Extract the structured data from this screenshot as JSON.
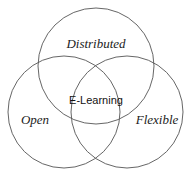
{
  "diagram": {
    "type": "venn",
    "sets": [
      {
        "id": "distributed",
        "label": "Distributed"
      },
      {
        "id": "open",
        "label": "Open"
      },
      {
        "id": "flexible",
        "label": "Flexible"
      }
    ],
    "intersection": {
      "label": "E-Learning"
    },
    "colors": {
      "stroke": "#555555",
      "text": "#222222",
      "background": "#ffffff"
    }
  }
}
